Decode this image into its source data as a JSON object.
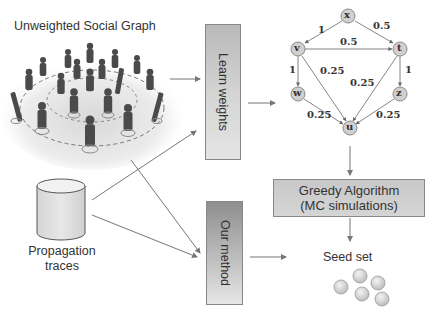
{
  "social_graph": {
    "title": "Unweighted Social Graph"
  },
  "traces": {
    "label_line1": "Propagation",
    "label_line2": "traces"
  },
  "boxes": {
    "learn_weights": "Learn weights",
    "our_method": "Our method",
    "greedy_line1": "Greedy Algorithm",
    "greedy_line2": "(MC simulations)"
  },
  "seed": {
    "label": "Seed set",
    "count": 5
  },
  "weighted_graph": {
    "nodes": [
      {
        "id": "x",
        "label": "x"
      },
      {
        "id": "v",
        "label": "v"
      },
      {
        "id": "t",
        "label": "t"
      },
      {
        "id": "w",
        "label": "w"
      },
      {
        "id": "z",
        "label": "z"
      },
      {
        "id": "u",
        "label": "u"
      }
    ],
    "edges": [
      {
        "from": "x",
        "to": "v",
        "weight": "1"
      },
      {
        "from": "x",
        "to": "t",
        "weight": "0.5"
      },
      {
        "from": "v",
        "to": "t",
        "weight": "0.5"
      },
      {
        "from": "v",
        "to": "w",
        "weight": "1"
      },
      {
        "from": "v",
        "to": "u",
        "weight": "0.25"
      },
      {
        "from": "t",
        "to": "u",
        "weight": "0.25"
      },
      {
        "from": "t",
        "to": "z",
        "weight": "1"
      },
      {
        "from": "w",
        "to": "u",
        "weight": "0.25"
      },
      {
        "from": "z",
        "to": "u",
        "weight": "0.25"
      }
    ]
  },
  "colors": {
    "node_fill": "#d0d0d0",
    "node_stroke": "#888888",
    "arrow": "#777777",
    "figure": "#4a4a4a"
  }
}
